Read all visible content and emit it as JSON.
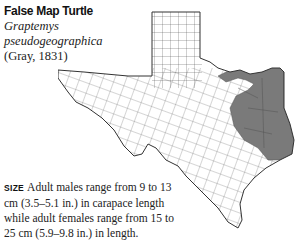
{
  "species": {
    "common_name": "False Map Turtle",
    "scientific_name_line1": "Graptemys",
    "scientific_name_line2": "pseudogeographica",
    "authority": "(Gray, 1831)"
  },
  "map": {
    "region": "Texas county map",
    "range_fill_color": "#7a7a7a",
    "outline_color": "#333333",
    "range_description": "shaded eastern Texas"
  },
  "size": {
    "label": "SIZE",
    "text": "Adult males range from 9 to 13 cm (3.5–5.1 in.) in carapace length while adult females range from 15 to 25 cm (5.9–9.8 in.) in length."
  }
}
